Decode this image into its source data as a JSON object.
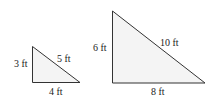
{
  "figure": {
    "fill_color": "#f4f4f4",
    "stroke_color": "#333333",
    "triangles": [
      {
        "name": "small",
        "legs": {
          "vertical": "3 ft",
          "horizontal": "4 ft"
        },
        "hypotenuse": "5 ft"
      },
      {
        "name": "large",
        "legs": {
          "vertical": "6 ft",
          "horizontal": "8 ft"
        },
        "hypotenuse": "10 ft"
      }
    ]
  }
}
